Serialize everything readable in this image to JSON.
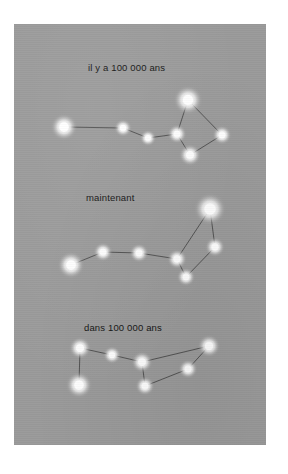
{
  "figure": {
    "title_visible": false,
    "background_color": "#9a9a9a",
    "plate_color": "#ffffff",
    "star_color": "#ffffff",
    "line_color": "#3c3c3c",
    "caption_color": "#141414",
    "panels": [
      {
        "id": "past",
        "caption": "il y a 100 000 ans",
        "caption_x": 74,
        "caption_y": 38
      },
      {
        "id": "present",
        "caption": "maintenant",
        "caption_x": 72,
        "caption_y": 168
      },
      {
        "id": "future",
        "caption": "dans 100 000 ans",
        "caption_x": 70,
        "caption_y": 298
      }
    ]
  },
  "chart_data": {
    "type": "scatter",
    "title": "",
    "subtitle": "",
    "xlabel": "",
    "ylabel": "",
    "grid": false,
    "legend": "none",
    "units": "pixels within gray plate (252 x 421)",
    "series": [
      {
        "name": "il y a 100 000 ans",
        "caption": "il y a 100 000 ans",
        "stars": [
          {
            "id": "s1",
            "x": 50,
            "y": 103,
            "r": 7.5
          },
          {
            "id": "s2",
            "x": 109,
            "y": 104,
            "r": 5.0
          },
          {
            "id": "s3",
            "x": 134,
            "y": 114,
            "r": 4.6
          },
          {
            "id": "s4",
            "x": 163,
            "y": 110,
            "r": 5.4
          },
          {
            "id": "s5",
            "x": 174,
            "y": 76,
            "r": 8.2
          },
          {
            "id": "s6",
            "x": 208,
            "y": 111,
            "r": 5.4
          },
          {
            "id": "s7",
            "x": 176,
            "y": 131,
            "r": 6.2
          }
        ],
        "links": [
          [
            "s1",
            "s2"
          ],
          [
            "s2",
            "s3"
          ],
          [
            "s3",
            "s4"
          ],
          [
            "s4",
            "s5"
          ],
          [
            "s5",
            "s6"
          ],
          [
            "s6",
            "s7"
          ],
          [
            "s7",
            "s4"
          ]
        ]
      },
      {
        "name": "maintenant",
        "caption": "maintenant",
        "stars": [
          {
            "id": "s1",
            "x": 57,
            "y": 241,
            "r": 7.6
          },
          {
            "id": "s2",
            "x": 89,
            "y": 228,
            "r": 5.4
          },
          {
            "id": "s3",
            "x": 125,
            "y": 229,
            "r": 5.4
          },
          {
            "id": "s4",
            "x": 163,
            "y": 235,
            "r": 5.6
          },
          {
            "id": "s5",
            "x": 196,
            "y": 185,
            "r": 9.0
          },
          {
            "id": "s6",
            "x": 201,
            "y": 223,
            "r": 5.6
          },
          {
            "id": "s7",
            "x": 172,
            "y": 253,
            "r": 5.2
          }
        ],
        "links": [
          [
            "s1",
            "s2"
          ],
          [
            "s2",
            "s3"
          ],
          [
            "s3",
            "s4"
          ],
          [
            "s4",
            "s5"
          ],
          [
            "s5",
            "s6"
          ],
          [
            "s6",
            "s7"
          ],
          [
            "s7",
            "s4"
          ]
        ]
      },
      {
        "name": "dans 100 000 ans",
        "caption": "dans 100 000 ans",
        "stars": [
          {
            "id": "s1",
            "x": 66,
            "y": 324,
            "r": 6.2
          },
          {
            "id": "s2",
            "x": 65,
            "y": 361,
            "r": 7.4
          },
          {
            "id": "s3",
            "x": 98,
            "y": 331,
            "r": 5.0
          },
          {
            "id": "s4",
            "x": 128,
            "y": 338,
            "r": 6.0
          },
          {
            "id": "s5",
            "x": 195,
            "y": 322,
            "r": 6.4
          },
          {
            "id": "s6",
            "x": 174,
            "y": 345,
            "r": 5.4
          },
          {
            "id": "s7",
            "x": 131,
            "y": 362,
            "r": 5.4
          }
        ],
        "links": [
          [
            "s1",
            "s2"
          ],
          [
            "s1",
            "s3"
          ],
          [
            "s3",
            "s4"
          ],
          [
            "s4",
            "s5"
          ],
          [
            "s5",
            "s6"
          ],
          [
            "s6",
            "s7"
          ],
          [
            "s7",
            "s4"
          ]
        ]
      }
    ]
  }
}
